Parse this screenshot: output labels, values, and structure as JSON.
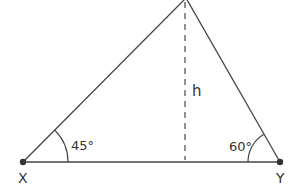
{
  "diagram": {
    "type": "triangle",
    "vertices": {
      "X": {
        "label": "X",
        "x": 23,
        "y": 162
      },
      "Y": {
        "label": "Y",
        "x": 280,
        "y": 162
      },
      "apex": {
        "label": "",
        "x": 186,
        "y": -2
      }
    },
    "angles": [
      {
        "vertex": "X",
        "label": "45°"
      },
      {
        "vertex": "Y",
        "label": "60°"
      }
    ],
    "height": {
      "label": "h",
      "style": "dashed"
    },
    "colors": {
      "line": "#444444",
      "text": "#333333",
      "background": "#ffffff"
    }
  }
}
